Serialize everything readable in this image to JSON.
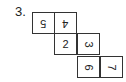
{
  "problem": {
    "label": "3."
  },
  "net": {
    "cells": [
      {
        "value": "5",
        "row": 0,
        "col": 0,
        "rotation": 180
      },
      {
        "value": "4",
        "row": 0,
        "col": 1,
        "rotation": 180
      },
      {
        "value": "2",
        "row": 1,
        "col": 1,
        "rotation": 0
      },
      {
        "value": "3",
        "row": 1,
        "col": 2,
        "rotation": 90
      },
      {
        "value": "6",
        "row": 2,
        "col": 2,
        "rotation": 90
      },
      {
        "value": "7",
        "row": 2,
        "col": 3,
        "rotation": 90
      }
    ]
  }
}
